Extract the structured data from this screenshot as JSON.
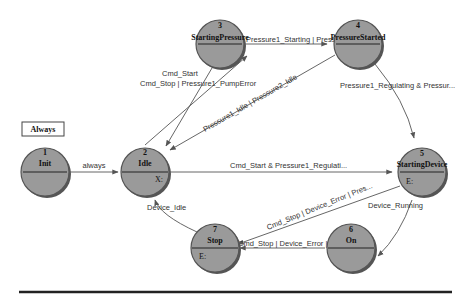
{
  "diagram": {
    "type": "state-machine",
    "always_box": {
      "label": "Always"
    },
    "states": [
      {
        "id": 1,
        "num": "1",
        "name": "Init",
        "action": ""
      },
      {
        "id": 2,
        "num": "2",
        "name": "Idle",
        "action": "X:"
      },
      {
        "id": 3,
        "num": "3",
        "name": "StartingPressure",
        "action": ""
      },
      {
        "id": 4,
        "num": "4",
        "name": "PressureStarted",
        "action": ""
      },
      {
        "id": 5,
        "num": "5",
        "name": "StartingDevice",
        "action": "E:"
      },
      {
        "id": 6,
        "num": "6",
        "name": "On",
        "action": ""
      },
      {
        "id": 7,
        "num": "7",
        "name": "Stop",
        "action": "E:"
      }
    ],
    "transitions": [
      {
        "from": 1,
        "to": 2,
        "label": "always"
      },
      {
        "from": 2,
        "to": 3,
        "label": "Cmd_Start"
      },
      {
        "from": 3,
        "to": 2,
        "label": "Cmd_Stop | Pressure1_PumpError"
      },
      {
        "from": 3,
        "to": 4,
        "label": "Pressure1_Starting | Pressure..."
      },
      {
        "from": 4,
        "to": 2,
        "label": "Pressure1_Idle | Pressure2_Idle"
      },
      {
        "from": 4,
        "to": 5,
        "label": "Pressure1_Regulating & Pressur..."
      },
      {
        "from": 2,
        "to": 5,
        "label": "Cmd_Start & Pressure1_Regulati..."
      },
      {
        "from": 5,
        "to": 7,
        "label": "Cmd_Stop | Device_Error | Pres..."
      },
      {
        "from": 5,
        "to": 6,
        "label": "Device_Running"
      },
      {
        "from": 6,
        "to": 7,
        "label": "Cmd_Stop | Device_Error | Pres..."
      },
      {
        "from": 7,
        "to": 2,
        "label": "Device_Idle"
      }
    ]
  }
}
